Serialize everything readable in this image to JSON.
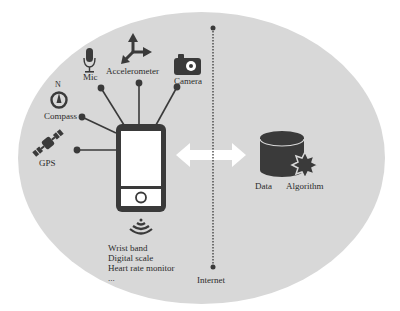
{
  "diagram": {
    "sensors": [
      {
        "id": "mic",
        "label": "Mic",
        "icon": "microphone-icon"
      },
      {
        "id": "accelerometer",
        "label": "Accelerometer",
        "icon": "axes-arrows-icon"
      },
      {
        "id": "camera",
        "label": "Camera",
        "icon": "camera-icon"
      },
      {
        "id": "compass",
        "label": "Compass",
        "icon": "compass-icon",
        "north_label": "N"
      },
      {
        "id": "gps",
        "label": "GPS",
        "icon": "satellite-icon"
      }
    ],
    "device": {
      "icon": "smartphone-icon"
    },
    "wireless": {
      "icon": "wireless-signal-icon",
      "devices": [
        "Wrist band",
        "Digital scale",
        "Heart rate monitor",
        "..."
      ]
    },
    "network": {
      "label": "Internet"
    },
    "server": {
      "data_label": "Data",
      "algorithm_label": "Algorithm"
    },
    "colors": {
      "background": "#ffffff",
      "ellipse": "#d8d8d8",
      "icon": "#3a3a3a",
      "arrow": "#ffffff"
    }
  }
}
